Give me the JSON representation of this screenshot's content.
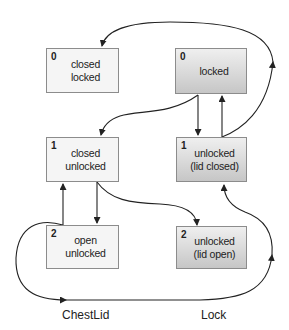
{
  "diagram": {
    "machines": [
      {
        "name": "ChestLid",
        "states": [
          {
            "index": "0",
            "line1": "closed",
            "line2": "locked"
          },
          {
            "index": "1",
            "line1": "closed",
            "line2": "unlocked"
          },
          {
            "index": "2",
            "line1": "open",
            "line2": "unlocked"
          }
        ]
      },
      {
        "name": "Lock",
        "states": [
          {
            "index": "0",
            "line1": "locked",
            "line2": ""
          },
          {
            "index": "1",
            "line1": "unlocked",
            "line2": "(lid closed)"
          },
          {
            "index": "2",
            "line1": "unlocked",
            "line2": "(lid open)"
          }
        ]
      }
    ],
    "colors": {
      "line": "#222222",
      "box_border": "#8c8c8c",
      "light_box": "#f5f5f5",
      "dark_box_top": "#efefef",
      "dark_box_bottom": "#c6c6c6"
    }
  }
}
